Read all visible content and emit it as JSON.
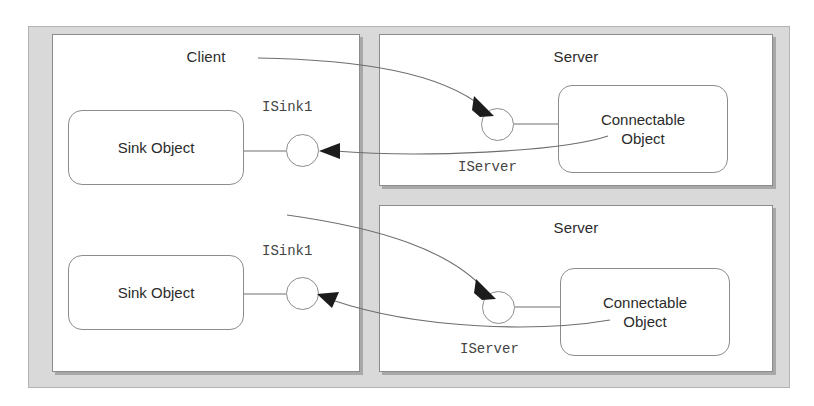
{
  "diagram": {
    "panels": {
      "client": {
        "label": "Client"
      },
      "server_top": {
        "label": "Server"
      },
      "server_bottom": {
        "label": "Server"
      }
    },
    "objects": {
      "sink_top": {
        "label": "Sink Object"
      },
      "sink_bottom": {
        "label": "Sink Object"
      },
      "connectable_top": {
        "label": "Connectable\nObject",
        "line1": "Connectable",
        "line2": "Object"
      },
      "connectable_bottom": {
        "label": "Connectable\nObject",
        "line1": "Connectable",
        "line2": "Object"
      }
    },
    "interfaces": {
      "isink1_top": {
        "label": "ISink1"
      },
      "isink1_bottom": {
        "label": "ISink1"
      },
      "iserver_top": {
        "label": "IServer"
      },
      "iserver_bottom": {
        "label": "IServer"
      }
    },
    "colors": {
      "frame_fill": "#d9d9d9",
      "panel_fill": "#ffffff",
      "stroke": "#8c8c8c",
      "connector_stroke": "#6e6e6e",
      "arrowhead": "#1c1c1c",
      "text": "#2b2b2b",
      "mono_text": "#444444"
    }
  }
}
